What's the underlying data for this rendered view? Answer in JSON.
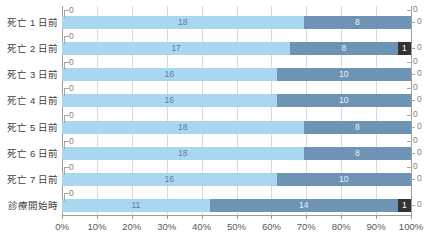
{
  "chart_data": {
    "type": "bar",
    "orientation": "horizontal",
    "stacked": true,
    "normalized": "100%",
    "title": "",
    "xlabel": "",
    "ylabel": "",
    "xlim": [
      0,
      100
    ],
    "grid": true,
    "legend": "none",
    "xticks": [
      "0%",
      "10%",
      "20%",
      "30%",
      "40%",
      "50%",
      "60%",
      "70%",
      "80%",
      "90%",
      "100%"
    ],
    "xtick_values": [
      0,
      10,
      20,
      30,
      40,
      50,
      60,
      70,
      80,
      90,
      100
    ],
    "categories": [
      "死亡 1 日前",
      "死亡 2 日前",
      "死亡 3 日前",
      "死亡 4 日前",
      "死亡 5 日前",
      "死亡 6 日前",
      "死亡 7 日前",
      "診療開始時"
    ],
    "series": [
      {
        "name": "series-1",
        "color": "#a9d6f1",
        "values": [
          18,
          17,
          16,
          16,
          18,
          18,
          16,
          11
        ]
      },
      {
        "name": "series-2",
        "color": "#6e94b5",
        "values": [
          8,
          8,
          10,
          10,
          8,
          8,
          10,
          14
        ]
      },
      {
        "name": "series-3",
        "color": "#333333",
        "values": [
          0,
          1,
          0,
          0,
          0,
          0,
          0,
          1
        ]
      }
    ],
    "rows": [
      {
        "category": "死亡 1 日前",
        "left_callouts": [
          "0"
        ],
        "right_callouts": [
          "0",
          "0"
        ],
        "segments": [
          {
            "value": 18,
            "label": "18",
            "color": "#a9d6f1",
            "percent": 69.2
          },
          {
            "value": 8,
            "label": "8",
            "color": "#6e94b5",
            "percent": 30.8
          }
        ]
      },
      {
        "category": "死亡 2 日前",
        "left_callouts": [
          "0"
        ],
        "right_callouts": [
          "0"
        ],
        "segments": [
          {
            "value": 17,
            "label": "17",
            "color": "#a9d6f1",
            "percent": 65.4
          },
          {
            "value": 8,
            "label": "8",
            "color": "#6e94b5",
            "percent": 30.8
          },
          {
            "value": 1,
            "label": "1",
            "color": "#333333",
            "percent": 3.8
          }
        ]
      },
      {
        "category": "死亡 3 日前",
        "left_callouts": [
          "0"
        ],
        "right_callouts": [
          "0",
          "0"
        ],
        "segments": [
          {
            "value": 16,
            "label": "16",
            "color": "#a9d6f1",
            "percent": 61.5
          },
          {
            "value": 10,
            "label": "10",
            "color": "#6e94b5",
            "percent": 38.5
          }
        ]
      },
      {
        "category": "死亡 4 日前",
        "left_callouts": [
          "0"
        ],
        "right_callouts": [
          "0",
          "0"
        ],
        "segments": [
          {
            "value": 16,
            "label": "16",
            "color": "#a9d6f1",
            "percent": 61.5
          },
          {
            "value": 10,
            "label": "10",
            "color": "#6e94b5",
            "percent": 38.5
          }
        ]
      },
      {
        "category": "死亡 5 日前",
        "left_callouts": [
          "0"
        ],
        "right_callouts": [
          "0",
          "0"
        ],
        "segments": [
          {
            "value": 18,
            "label": "18",
            "color": "#a9d6f1",
            "percent": 69.2
          },
          {
            "value": 8,
            "label": "8",
            "color": "#6e94b5",
            "percent": 30.8
          }
        ]
      },
      {
        "category": "死亡 6 日前",
        "left_callouts": [
          "0"
        ],
        "right_callouts": [
          "0",
          "0"
        ],
        "segments": [
          {
            "value": 18,
            "label": "18",
            "color": "#a9d6f1",
            "percent": 69.2
          },
          {
            "value": 8,
            "label": "8",
            "color": "#6e94b5",
            "percent": 30.8
          }
        ]
      },
      {
        "category": "死亡 7 日前",
        "left_callouts": [
          "0"
        ],
        "right_callouts": [
          "0",
          "0"
        ],
        "segments": [
          {
            "value": 16,
            "label": "16",
            "color": "#a9d6f1",
            "percent": 61.5
          },
          {
            "value": 10,
            "label": "10",
            "color": "#6e94b5",
            "percent": 38.5
          }
        ]
      },
      {
        "category": "診療開始時",
        "left_callouts": [
          "0"
        ],
        "right_callouts": [
          "0"
        ],
        "segments": [
          {
            "value": 11,
            "label": "11",
            "color": "#a9d6f1",
            "percent": 42.3
          },
          {
            "value": 14,
            "label": "14",
            "color": "#6e94b5",
            "percent": 53.9
          },
          {
            "value": 1,
            "label": "1",
            "color": "#333333",
            "percent": 3.8
          }
        ]
      }
    ],
    "colors": {
      "series_1": "#a9d6f1",
      "series_2": "#6e94b5",
      "series_3": "#333333",
      "gridline": "#d9d9d9",
      "axis": "#9c9c9c",
      "text": "#595959"
    }
  }
}
